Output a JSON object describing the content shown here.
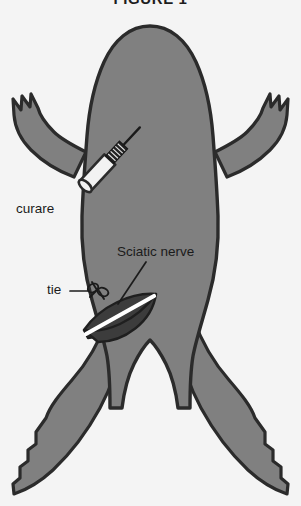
{
  "figure": {
    "title": "FIGURE 1",
    "view": "dorsal"
  },
  "colors": {
    "background": "#f4f4f4",
    "body_fill": "#808080",
    "outline": "#2b2b2b",
    "incision_fill": "#3c3c3c",
    "nerve": "#ffffff",
    "syringe_fill": "#f2f2f2",
    "needle": "#1a1a1a",
    "text": "#1b1b1b"
  },
  "annotations": [
    {
      "id": "curare",
      "label": "curare",
      "x": 16,
      "y": 202,
      "points_to": "syringe-injection-site"
    },
    {
      "id": "sciatic-nerve",
      "label": "Sciatic nerve",
      "x": 117,
      "y": 245,
      "points_to": "exposed-nerve-strand"
    },
    {
      "id": "tie",
      "label": "tie",
      "x": 47,
      "y": 283,
      "points_to": "ligature-knot"
    }
  ],
  "parts": {
    "body": "frog-body-silhouette",
    "syringe": "curare-syringe",
    "incision": "thigh-incision",
    "nerve": "sciatic-nerve-strand",
    "knot": "ligature-knot"
  }
}
